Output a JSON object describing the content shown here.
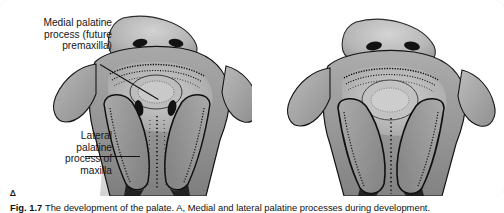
{
  "figure": {
    "panel_a_letter": "A",
    "panel_b_letter": "B",
    "callouts": {
      "medial": "Medial palatine\nprocess (future\npremaxilla)",
      "medial_line1": "Medial palatine",
      "medial_line2": "process (future",
      "medial_line3": "premaxilla)",
      "lateral_line1": "Lateral",
      "lateral_line2": "palatine",
      "lateral_line3": "process of",
      "lateral_line4": "maxilla"
    },
    "caption": {
      "label": "Fig. 1.7",
      "text": "The development of the palate. A, Medial and lateral palatine processes during development."
    },
    "colors": {
      "background": "#ffffff",
      "card_border": "#d9d9d9",
      "text": "#161616",
      "leader_line": "#111111",
      "specimen_mid_gray": "#9a9a9a",
      "specimen_light_gray": "#c9c9c9",
      "specimen_dark_gray": "#6f6f6f",
      "specimen_outline": "#111111"
    },
    "illustration": {
      "subject": "embryonic palate specimen photograph",
      "panel_a_name": "palate-specimen-a",
      "panel_b_name": "palate-specimen-b"
    }
  }
}
